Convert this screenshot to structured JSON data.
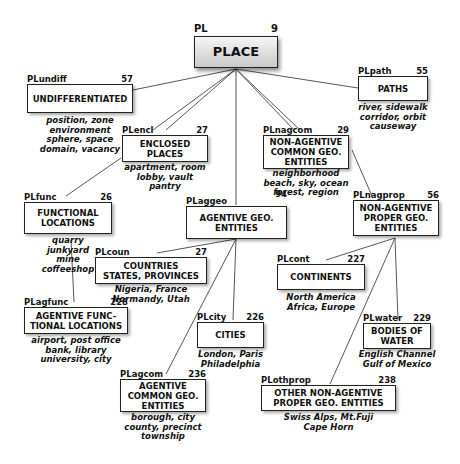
{
  "diagram": {
    "nodes": {
      "place": {
        "code": "PL",
        "count": "9",
        "label": "PLACE",
        "examples": ""
      },
      "undiff": {
        "code": "PLundiff",
        "count": "57",
        "label": "UNDIFFERENTIATED",
        "examples": "position, zone\nenvironment\nsphere, space\ndomain, vacancy"
      },
      "path": {
        "code": "PLpath",
        "count": "55",
        "label": "PATHS",
        "examples": "river, sidewalk\ncorridor, orbit\ncauseway"
      },
      "encl": {
        "code": "PLencl",
        "count": "27",
        "label": "ENCLOSED\nPLACES",
        "examples": "apartment, room\nlobby, vault\npantry"
      },
      "nagcom": {
        "code": "PLnagcom",
        "count": "29",
        "label": "NON-AGENTIVE\nCOMMON GEO.\nENTITIES",
        "examples": "neighborhood\nbeach, sky, ocean\nforest, region"
      },
      "func": {
        "code": "PLfunc",
        "count": "26",
        "label": "FUNCTIONAL\nLOCATIONS",
        "examples": "quarry\njunkyard\nmine\ncoffeeshop"
      },
      "aggeo": {
        "code": "PLaggeo",
        "count": "94",
        "label": "AGENTIVE GEO.\nENTITIES",
        "examples": ""
      },
      "nagprop": {
        "code": "PLnagprop",
        "count": "56",
        "label": "NON-AGENTIVE\nPROPER GEO.\nENTITIES",
        "examples": ""
      },
      "coun": {
        "code": "PLcoun",
        "count": "27",
        "label": "COUNTRIES\nSTATES, PROVINCES",
        "examples": "Nigeria, France\nNormandy, Utah"
      },
      "cont": {
        "code": "PLcont",
        "count": "227",
        "label": "CONTINENTS",
        "examples": "North America\nAfrica, Europe"
      },
      "agfunc": {
        "code": "PLagfunc",
        "count": "228",
        "label": "AGENTIVE FUNC-\nTIONAL LOCATIONS",
        "examples": "airport, post office\nbank, library\nuniversity, city"
      },
      "city": {
        "code": "PLcity",
        "count": "226",
        "label": "CITIES",
        "examples": "London, Paris\nPhiladelphia"
      },
      "water": {
        "code": "PLwater",
        "count": "229",
        "label": "BODIES OF\nWATER",
        "examples": "English Channel\nGulf of Mexico"
      },
      "agcom": {
        "code": "PLagcom",
        "count": "236",
        "label": "AGENTIVE\nCOMMON GEO.\nENTITIES",
        "examples": "borough, city\ncounty, precinct\ntownship"
      },
      "othprop": {
        "code": "PLothprop",
        "count": "238",
        "label": "OTHER NON-AGENTIVE\nPROPER GEO. ENTITIES",
        "examples": "Swiss Alps, Mt.Fuji\nCape Horn"
      }
    },
    "colors": {
      "line": "#444444",
      "border": "#222222",
      "root_fill_top": "#f6f6f6",
      "root_fill_bottom": "#c9c9c9"
    }
  }
}
